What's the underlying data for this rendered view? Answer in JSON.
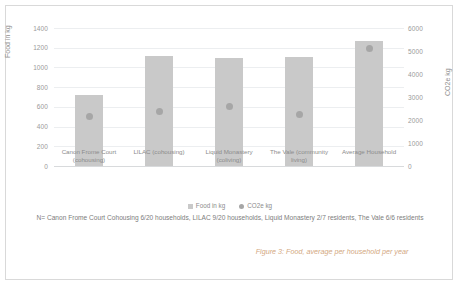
{
  "figure": {
    "caption": "Figure 3: Food, average per household per year",
    "footnote": "N= Canon Frome Court Cohousing 6/20 households, LILAC 9/20 households, Liquid Monastery 2/7 residents, The Vale 6/6 residents",
    "border_color": "#d9d9d9",
    "caption_color": "#d3a87f"
  },
  "legend": {
    "position": "bottom-center",
    "items": [
      {
        "label": "Food in kg",
        "marker": "square",
        "color": "#c9c9c9"
      },
      {
        "label": "CO2e kg",
        "marker": "circle",
        "color": "#a6a6a6"
      }
    ]
  },
  "chart_data": {
    "type": "bar",
    "title": "",
    "subtitle": "",
    "xlabel": "",
    "ylabel": "Food in kg",
    "y2label": "CO2e kg",
    "grid": true,
    "ylim": [
      0,
      1400
    ],
    "y2lim": [
      0,
      6000
    ],
    "yticks": [
      "0",
      "200",
      "400",
      "600",
      "800",
      "1000",
      "1200",
      "1400"
    ],
    "y2ticks": [
      "0",
      "1000",
      "2000",
      "3000",
      "4000",
      "5000",
      "6000"
    ],
    "categories": [
      "Canon Frome Court (cohousing)",
      "LILAC (cohousing)",
      "Liquid Monastery (coliving)",
      "The Vale (community living)",
      "Average Household"
    ],
    "series": [
      {
        "name": "Food in kg",
        "axis": "left",
        "type": "bar",
        "color": "#c9c9c9",
        "values": [
          720,
          1120,
          1100,
          1110,
          1270
        ]
      },
      {
        "name": "CO2e kg",
        "axis": "right",
        "type": "scatter",
        "color": "#a6a6a6",
        "values": [
          2150,
          2350,
          2600,
          2220,
          5100
        ]
      }
    ]
  }
}
